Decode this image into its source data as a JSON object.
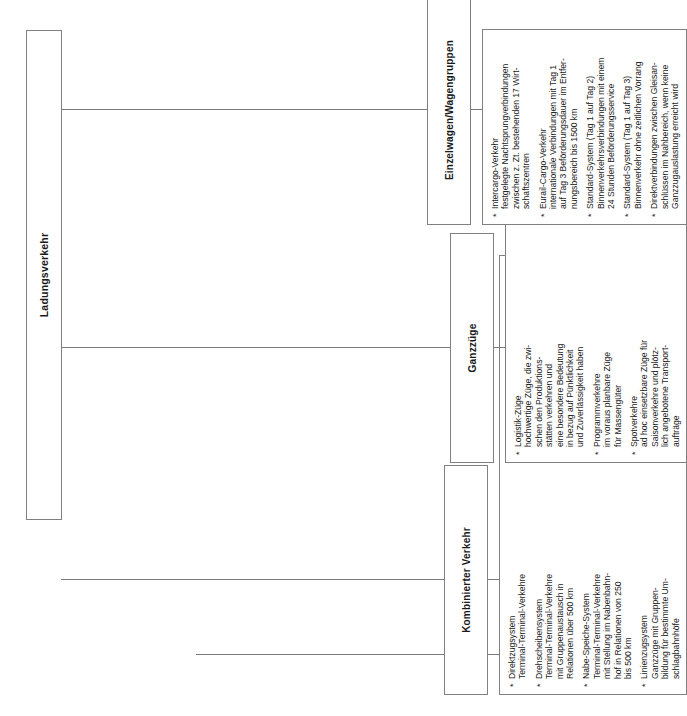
{
  "diagram": {
    "type": "organizational-tree",
    "orientation": "rotated-90-ccw",
    "language": "de",
    "root": {
      "label": "Ladungsverkehr"
    },
    "branches": [
      {
        "id": "einzelwagen",
        "header": "Einzelwagen/Wagengruppen",
        "bullet_marker": "*",
        "items": [
          "Intercargo-Verkehr\nfestgelegte Nachtsprungverbindungen\nzwischen z. Zt. bestehenden 17 Wirt-\nschaftszentren",
          "Eurail-Cargo-Verkehr\ninternationale Verbindungen mit Tag 1\nauf Tag 3 Beförderungsdauer im Entfer-\nnungsbereich bis 1500 km",
          "Standard-System (Tag 1 auf Tag 2)\nBinnenverkehrsverbindungen mit einem\n24 Stunden Beförderungsservice",
          "Standard-System (Tag 1 auf Tag 3)\nBinnenverkehr ohne zeitlichen Vorrang",
          "Direktverbindungen zwischen Gleisan-\nschlüssen im Nahbereich, wenn keine\nGanzzugauslastung erreicht wird"
        ]
      },
      {
        "id": "ganzzuege",
        "header": "Ganzzüge",
        "bullet_marker": "*",
        "items": [
          "Logistik-Züge\nhochwertige Züge, die zwi-\nschen den Produktions-\nstätten verkehren und\neine besondere Bedeutung\nin bezug auf Pünktlichkeit\nund Zuverlässigkeit haben",
          "Programmverkehre\nim voraus planbare Züge\nfür Massengüter",
          "Spotverkehre\nad hoc einsetzbare Züge für\nSaisonverkehre und plötz-\nlich angebotene Transport-\naufträge"
        ]
      },
      {
        "id": "kombinierter",
        "header": "Kombinierter Verkehr",
        "bullet_marker": "*",
        "items": [
          "Direktzugsystem\nTerminal-Terminal-Verkehre",
          "Drehscheibensystem\nTerminal-Terminal-Verkehre\nmit Gruppenaustausch in\nRelationen über 500 km",
          "Nabe-Speiche-System\nTerminal-Terminal-Verkehre\nmit Stellung im Nabenbahn-\nhof in Relationen von 250\nbis 500 km",
          "Linienzugsystem\nGanzzüge mit Gruppen-\nbildung für bestimmte Um-\nschlagbahnhöfe"
        ]
      }
    ],
    "colors": {
      "background": "#ffffff",
      "border": "#808080",
      "connector": "#7a7a7a",
      "text": "#1a1a1a"
    }
  }
}
